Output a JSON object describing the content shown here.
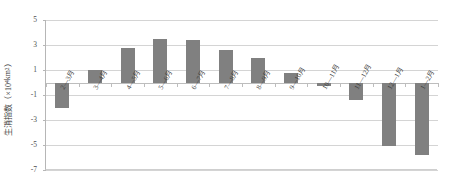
{
  "chart_data": {
    "type": "bar",
    "title": "",
    "xlabel": "",
    "ylabel": "生消指数（×10⁴ km²）",
    "ylabel_main": "生消指数（×10",
    "ylabel_sup": "4",
    "ylabel_tail": " km",
    "ylabel_sup2": "2",
    "ylabel_end": "）",
    "categories": [
      "2—3月",
      "3—4月",
      "4—5月",
      "5—6月",
      "6—7月",
      "7—8月",
      "8—9月",
      "9—10月",
      "10—11月",
      "11—12月",
      "12—1月",
      "1—2月"
    ],
    "values": [
      -2.0,
      1.0,
      2.8,
      3.5,
      3.4,
      2.6,
      2.0,
      0.8,
      -0.25,
      -1.4,
      -5.1,
      -5.8
    ],
    "ylim": [
      -7,
      5
    ],
    "yticks": [
      5,
      3,
      1,
      -1,
      -3,
      -5,
      -7
    ],
    "ytick_labels": [
      "5",
      "3",
      "1",
      "-1",
      "-3",
      "-5",
      "-7"
    ],
    "grid": true,
    "legend": "none",
    "bar_color": "#808080",
    "grid_color": "#d4d4d4",
    "axis_color": "#b6b6b6",
    "background": "#ffffff"
  }
}
